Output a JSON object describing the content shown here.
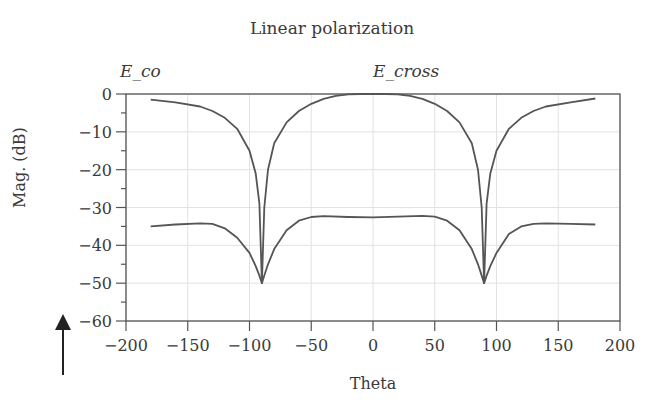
{
  "chart_data": {
    "type": "line",
    "title": "Linear polarization",
    "xlabel": "Theta",
    "ylabel": "Mag. (dB)",
    "xlim": [
      -200,
      200
    ],
    "ylim": [
      -60,
      0
    ],
    "xticks": [
      -200,
      -150,
      -100,
      -50,
      0,
      50,
      100,
      150,
      200
    ],
    "yticks": [
      0,
      -10,
      -20,
      -30,
      -40,
      -50,
      -60
    ],
    "grid": true,
    "legend_position": "annotations above plot",
    "annotations": [
      {
        "text": "E_co",
        "x_px": 152
      },
      {
        "text": "E_cross",
        "x_px": 404
      }
    ],
    "series": [
      {
        "name": "E_co",
        "x": [
          -180,
          -160,
          -140,
          -130,
          -120,
          -110,
          -100,
          -95,
          -92,
          -90,
          -88,
          -85,
          -80,
          -70,
          -60,
          -50,
          -40,
          -30,
          -20,
          -10,
          0,
          10,
          20,
          30,
          40,
          50,
          60,
          70,
          80,
          85,
          88,
          90,
          92,
          95,
          100,
          110,
          120,
          130,
          140,
          160,
          180
        ],
        "y": [
          -1.5,
          -2.2,
          -3.3,
          -4.5,
          -6.3,
          -9.2,
          -15,
          -21,
          -29,
          -50,
          -30,
          -20,
          -13,
          -7.5,
          -4.5,
          -2.6,
          -1.3,
          -0.5,
          -0.1,
          0,
          0,
          0,
          -0.1,
          -0.5,
          -1.3,
          -2.6,
          -4.5,
          -7.5,
          -13,
          -20,
          -30,
          -50,
          -29,
          -21,
          -15,
          -9.2,
          -6.3,
          -4.5,
          -3.3,
          -2.2,
          -1.2
        ]
      },
      {
        "name": "E_cross",
        "x": [
          -180,
          -160,
          -140,
          -130,
          -120,
          -110,
          -100,
          -95,
          -92,
          -90,
          -88,
          -85,
          -80,
          -70,
          -60,
          -50,
          -40,
          -20,
          0,
          20,
          40,
          50,
          60,
          70,
          80,
          85,
          88,
          90,
          92,
          95,
          100,
          110,
          120,
          130,
          140,
          160,
          180
        ],
        "y": [
          -35,
          -34.5,
          -34.2,
          -34.3,
          -35.5,
          -38,
          -42,
          -45.5,
          -48,
          -50,
          -48,
          -45,
          -41,
          -36,
          -33.5,
          -32.5,
          -32.3,
          -32.5,
          -32.6,
          -32.4,
          -32.2,
          -32.4,
          -33.5,
          -36,
          -41,
          -45,
          -48,
          -50,
          -48,
          -45.5,
          -42,
          -37,
          -35,
          -34.3,
          -34.2,
          -34.3,
          -34.5
        ]
      }
    ],
    "colors": {
      "axis": "#555555",
      "grid": "#e2e2e2",
      "curve": "#555555"
    },
    "decorations": {
      "arrow": "up-arrow at bottom-left"
    }
  }
}
